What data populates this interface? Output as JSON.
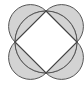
{
  "diagram": {
    "type": "geometry-lunes",
    "colors": {
      "fill": "#d3d3d3",
      "stroke": "#555555",
      "background": "#ffffff"
    },
    "center": [
      46,
      42
    ],
    "circle_radius": 31,
    "vertices": [
      [
        46,
        11
      ],
      [
        77,
        42
      ],
      [
        46,
        73
      ],
      [
        15,
        42
      ]
    ]
  }
}
